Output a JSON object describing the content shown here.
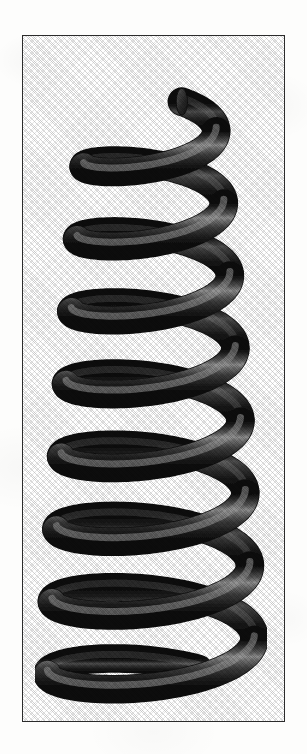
{
  "page": {
    "width": 307,
    "height": 754,
    "background_color": "#fdfdfc"
  },
  "frame": {
    "x": 22,
    "y": 35,
    "width": 263,
    "height": 687,
    "border_color": "#2b2b2b",
    "border_width": 1,
    "fill_color": "#ffffff"
  },
  "figure": {
    "name": "tapered helical coil spring",
    "render_style": "halftone-screened grayscale scan"
  },
  "coil": {
    "turns": 8,
    "tube_diameter": 27,
    "tube_color_dark": "#1d1d1d",
    "tube_color_mid": "#4a4a4a",
    "tube_color_highlight": "#9a9a9a",
    "tube_color_shadow": "#111111",
    "axis_x": 152,
    "top_y": 118,
    "bottom_y": 698,
    "pitch": 74,
    "radius_top": 62,
    "radius_bottom": 106,
    "squash": 0.3,
    "free_end": {
      "present": true,
      "cut_x": 157,
      "cut_y": 60,
      "label": "cut tube end"
    }
  }
}
